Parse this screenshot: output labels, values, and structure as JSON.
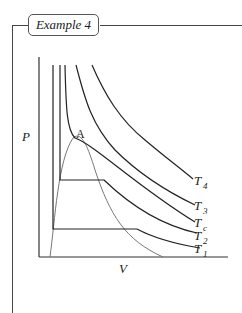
{
  "header": {
    "title": "Example 4"
  },
  "diagram": {
    "type": "pv-isotherms",
    "axes": {
      "y_label": "P",
      "x_label": "V"
    },
    "critical_point_label": "A",
    "isotherms": [
      {
        "name": "T4",
        "base": "T",
        "sub": "4"
      },
      {
        "name": "T3",
        "base": "T",
        "sub": "3"
      },
      {
        "name": "Tc",
        "base": "T",
        "sub": "c"
      },
      {
        "name": "T2",
        "base": "T",
        "sub": "2"
      },
      {
        "name": "T1",
        "base": "T",
        "sub": "1"
      }
    ],
    "colors": {
      "isotherm": "#222222",
      "coexistence_curve": "#777777",
      "frame": "#444444"
    }
  }
}
